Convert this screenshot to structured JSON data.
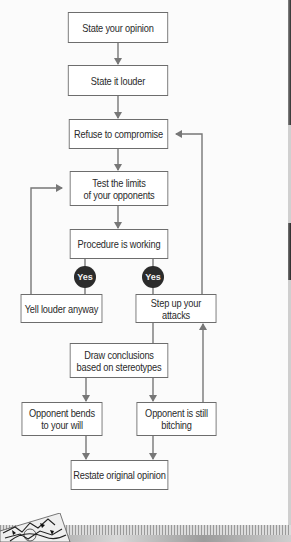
{
  "flowchart": {
    "nodes": [
      {
        "id": "state-opinion",
        "label": "State your opinion"
      },
      {
        "id": "state-louder",
        "label": "State it louder"
      },
      {
        "id": "refuse-compromise",
        "label": "Refuse to compromise"
      },
      {
        "id": "test-limits",
        "label": "Test the limits\nof your opponents"
      },
      {
        "id": "procedure-working",
        "label": "Procedure is working"
      },
      {
        "id": "yell-louder",
        "label": "Yell louder anyway"
      },
      {
        "id": "step-up-attacks",
        "label": "Step up your attacks"
      },
      {
        "id": "draw-conclusions",
        "label": "Draw conclusions\nbased on stereotypes"
      },
      {
        "id": "opponent-bends",
        "label": "Opponent bends\nto your will"
      },
      {
        "id": "opponent-bitching",
        "label": "Opponent is still\nbitching"
      },
      {
        "id": "restate-opinion",
        "label": "Restate original opinion"
      }
    ],
    "decisions": [
      {
        "label": "Yes"
      },
      {
        "label": "Yes"
      }
    ],
    "edges": [
      [
        "state-opinion",
        "state-louder"
      ],
      [
        "state-louder",
        "refuse-compromise"
      ],
      [
        "refuse-compromise",
        "test-limits"
      ],
      [
        "test-limits",
        "procedure-working"
      ],
      [
        "procedure-working",
        "yell-louder",
        "Yes"
      ],
      [
        "procedure-working",
        "step-up-attacks",
        "Yes"
      ],
      [
        "yell-louder",
        "test-limits"
      ],
      [
        "step-up-attacks",
        "refuse-compromise"
      ],
      [
        "step-up-attacks",
        "draw-conclusions"
      ],
      [
        "draw-conclusions",
        "opponent-bends"
      ],
      [
        "draw-conclusions",
        "opponent-bitching"
      ],
      [
        "opponent-bitching",
        "step-up-attacks"
      ],
      [
        "opponent-bends",
        "restate-opinion"
      ],
      [
        "opponent-bitching",
        "restate-opinion"
      ]
    ]
  },
  "colors": {
    "line": "#777777",
    "box_border": "#6d6d6d",
    "decision_fill": "#2b2b2b",
    "text": "#2a2a2a"
  }
}
